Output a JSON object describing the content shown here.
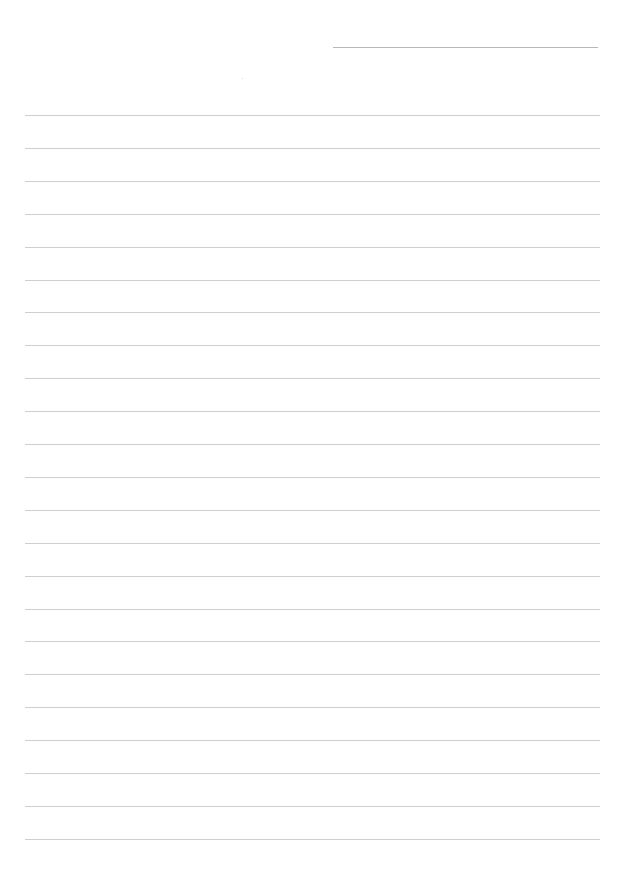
{
  "page": {
    "type": "lined-paper",
    "background": "#ffffff",
    "line_color": "#cfcfcf",
    "header_line_color": "#b8b8b8",
    "line_count": 23,
    "first_line_y": 115,
    "line_spacing": 32.9
  }
}
